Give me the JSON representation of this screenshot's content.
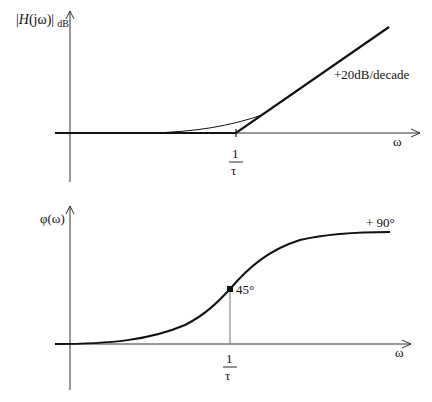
{
  "top_plot": {
    "y_label_main": "|H(jω)|",
    "y_label_prefix": "|",
    "y_label_H": "H",
    "y_label_rest": "(jω)|",
    "y_label_sub": "dB",
    "x_label": "ω",
    "corner_tick_num": "1",
    "corner_tick_den": "τ",
    "slope_annotation": "+20dB/decade"
  },
  "bottom_plot": {
    "y_label": "φ(ω)",
    "x_label": "ω",
    "tick_num": "1",
    "tick_den": "τ",
    "point_annotation": "45°",
    "asymptote_annotation": "+ 90°"
  },
  "colors": {
    "curve": "#111111",
    "axis": "#333333",
    "guide": "#777777"
  }
}
